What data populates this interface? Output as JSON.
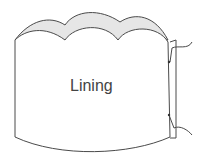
{
  "diagram": {
    "label": "Lining",
    "colors": {
      "stroke": "#4a4a4a",
      "fill_back": "#e6e6e6",
      "fill_front": "#ffffff"
    }
  }
}
